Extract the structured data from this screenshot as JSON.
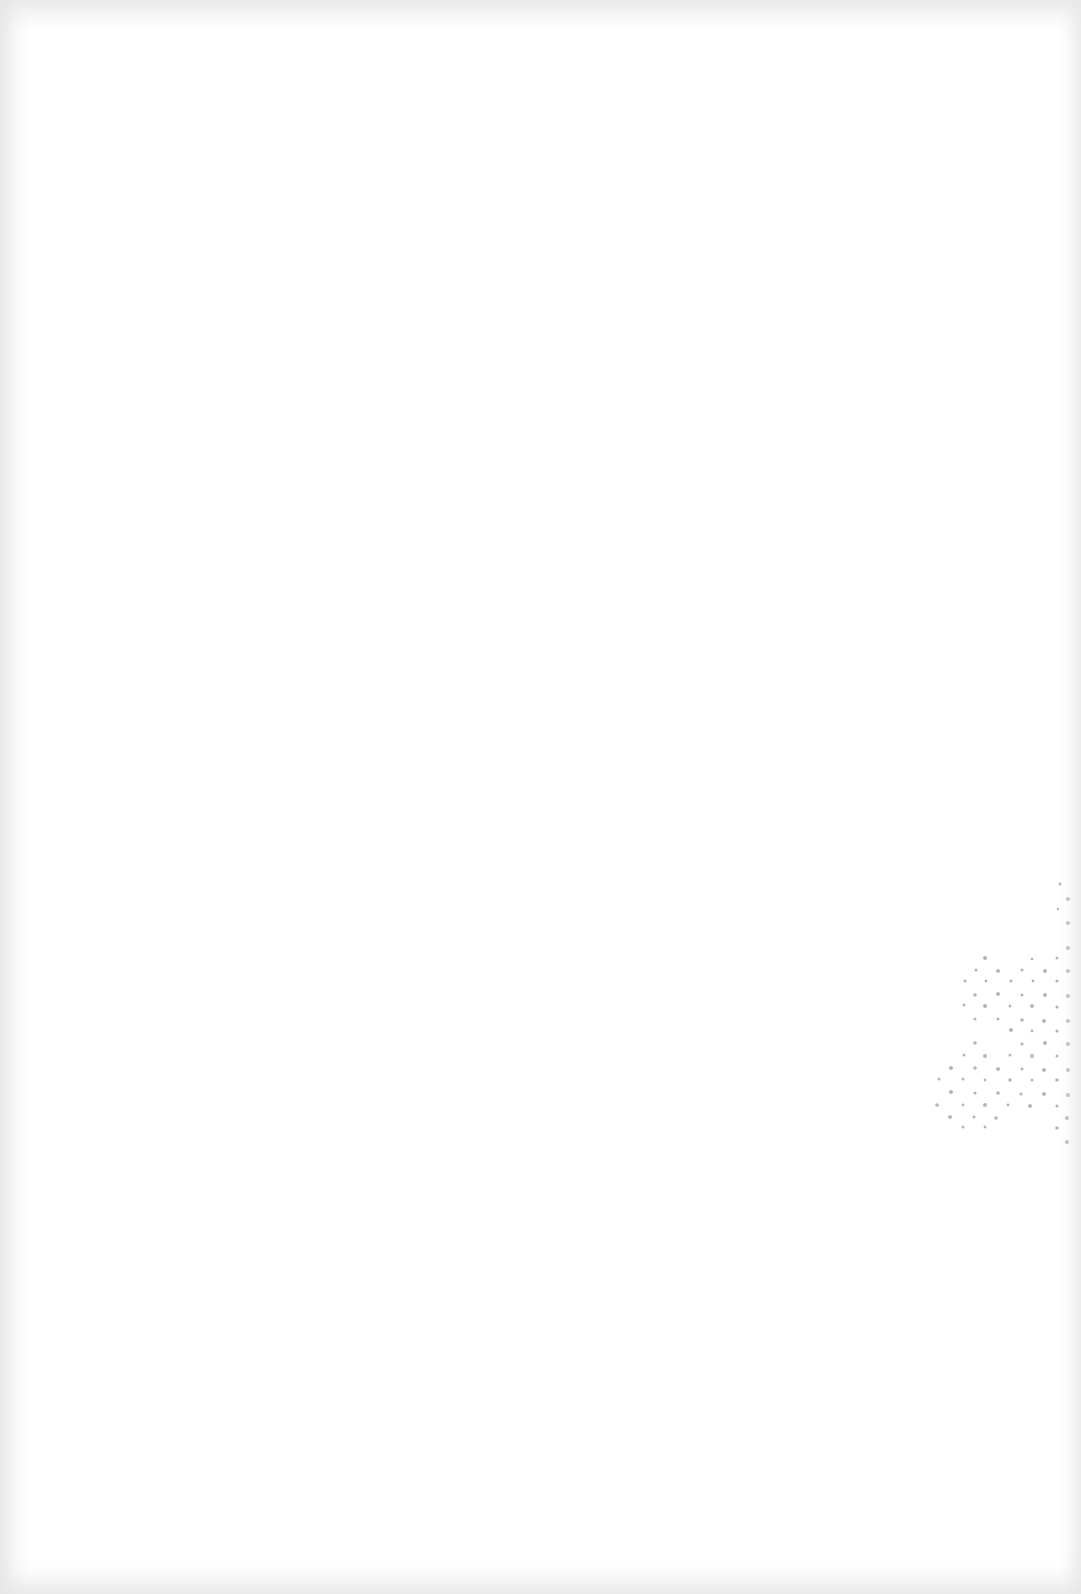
{
  "page": {
    "type": "blank-scanned-page",
    "background_color": "#ffffff",
    "edge_shade_color": "#e6e6e6",
    "bleed_through_color": "#b5b5b5",
    "text": ""
  }
}
